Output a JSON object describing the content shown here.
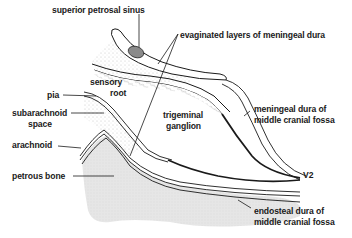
{
  "diagram": {
    "type": "anatomical-cross-section"
  },
  "labels": {
    "superior_petrosal_sinus": "superior petrosal sinus",
    "evaginated_layers": "evaginated layers of meningeal dura",
    "sensory_root_line1": "sensory",
    "sensory_root_line2": "root",
    "pia": "pia",
    "subarachnoid_line1": "subarachnoid",
    "subarachnoid_line2": "space",
    "arachnoid": "arachnoid",
    "trigeminal_line1": "trigeminal",
    "trigeminal_line2": "ganglion",
    "meningeal_dura_line1": "meningeal dura of",
    "meningeal_dura_line2": "middle cranial fossa",
    "petrous_bone": "petrous bone",
    "v2": "V2",
    "endosteal_line1": "endosteal dura of",
    "endosteal_line2": "middle cranial fossa"
  },
  "colors": {
    "line": "#1a1a1a",
    "bone_fill": "#e4e4e4",
    "sinus_fill": "#8a8a8a",
    "stipple": "#c8c8c8"
  }
}
